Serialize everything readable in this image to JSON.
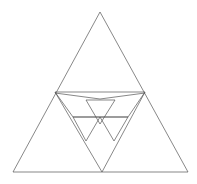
{
  "figure": {
    "background_color": "#ffffff",
    "stroke_color": "#555555",
    "stroke_width": 0.7,
    "canvas": {
      "width": 197,
      "height": 184
    }
  },
  "chart_data": {
    "type": "diagram",
    "xlabel": "",
    "ylabel": "",
    "xlim": [
      0,
      197
    ],
    "ylim": [
      0,
      184
    ],
    "grid": false,
    "legend": "none",
    "shapes": [
      {
        "name": "outer-triangle",
        "kind": "polygon",
        "closed": true,
        "points": [
          [
            100,
            12
          ],
          [
            13,
            172
          ],
          [
            188,
            172
          ]
        ]
      },
      {
        "name": "mid-left-chord",
        "kind": "polyline",
        "closed": false,
        "points": [
          [
            55,
            92
          ],
          [
            145,
            92
          ]
        ]
      },
      {
        "name": "mid-sagging-chord",
        "kind": "polyline",
        "closed": false,
        "points": [
          [
            55,
            93
          ],
          [
            100,
            99
          ],
          [
            145,
            93
          ]
        ]
      },
      {
        "name": "inverted-big-triangle-left-edge",
        "kind": "polyline",
        "closed": false,
        "points": [
          [
            55,
            92
          ],
          [
            102,
            172
          ]
        ]
      },
      {
        "name": "inverted-big-triangle-right-edge",
        "kind": "polyline",
        "closed": false,
        "points": [
          [
            145,
            92
          ],
          [
            102,
            172
          ]
        ]
      },
      {
        "name": "inner-left-diagonal",
        "kind": "polyline",
        "closed": false,
        "points": [
          [
            55,
            92
          ],
          [
            73,
            117
          ]
        ]
      },
      {
        "name": "inner-right-diagonal",
        "kind": "polyline",
        "closed": false,
        "points": [
          [
            145,
            92
          ],
          [
            128,
            117
          ]
        ]
      },
      {
        "name": "inner-horizontal-bar",
        "kind": "polyline",
        "closed": false,
        "points": [
          [
            73,
            117
          ],
          [
            128,
            117
          ]
        ]
      },
      {
        "name": "upper-small-inverted-triangle",
        "kind": "polygon",
        "closed": true,
        "points": [
          [
            86,
            100
          ],
          [
            115,
            100
          ],
          [
            100,
            124
          ]
        ]
      },
      {
        "name": "lower-left-small-inverted-triangle",
        "kind": "polygon",
        "closed": true,
        "points": [
          [
            73,
            117
          ],
          [
            100,
            117
          ],
          [
            86,
            141
          ]
        ]
      },
      {
        "name": "lower-right-small-inverted-triangle",
        "kind": "polygon",
        "closed": true,
        "points": [
          [
            100,
            117
          ],
          [
            128,
            117
          ],
          [
            114,
            141
          ]
        ]
      }
    ],
    "vertex_labels": [],
    "annotations": []
  }
}
